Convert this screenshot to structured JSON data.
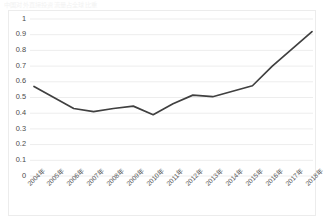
{
  "title": "中国对外直接投资流量占全球比重",
  "chart_data": {
    "type": "line",
    "title": "中国对外直接投资流量占全球比重",
    "xlabel": "",
    "ylabel": "",
    "categories": [
      "2004年",
      "2005年",
      "2006年",
      "2007年",
      "2008年",
      "2009年",
      "2010年",
      "2011年",
      "2012年",
      "2013年",
      "2014年",
      "2015年",
      "2016年",
      "2017年",
      "2018年"
    ],
    "values": [
      0.57,
      0.5,
      0.43,
      0.41,
      0.43,
      0.445,
      0.39,
      0.46,
      0.515,
      0.505,
      0.54,
      0.575,
      0.7,
      0.81,
      0.92
    ],
    "series": [
      {
        "name": "比重",
        "values": [
          0.57,
          0.5,
          0.43,
          0.41,
          0.43,
          0.445,
          0.39,
          0.46,
          0.515,
          0.505,
          0.54,
          0.575,
          0.7,
          0.81,
          0.92
        ]
      }
    ],
    "ylim": [
      0,
      1
    ],
    "yticks": [
      0,
      0.1,
      0.2,
      0.3,
      0.4,
      0.5,
      0.6,
      0.7,
      0.8,
      0.9,
      1
    ],
    "ytick_labels": [
      "0",
      "0.1",
      "0.2",
      "0.3",
      "0.4",
      "0.5",
      "0.6",
      "0.7",
      "0.8",
      "0.9",
      "1"
    ],
    "grid": "horizontal",
    "legend": "none",
    "line_color": "#404040",
    "grid_color": "#ededed",
    "plot_background": "#ffffff",
    "markers": "none"
  }
}
